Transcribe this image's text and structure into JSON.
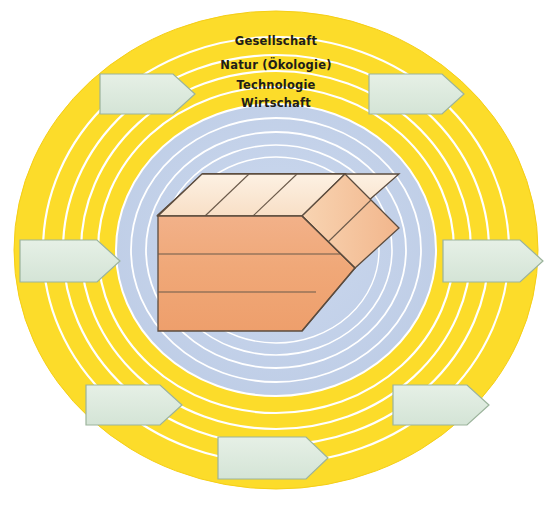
{
  "diagram": {
    "type": "concentric-rings-with-arrows",
    "canvas": {
      "width": 552,
      "height": 506
    }
  },
  "rings": {
    "environment_color": "#FCDC2A",
    "inner_color": "#C3D1E8",
    "separator_color": "#FFFFFF",
    "labels": [
      {
        "id": "gesellschaft",
        "label": "Gesellschaft",
        "x": 276,
        "y": 44
      },
      {
        "id": "natur",
        "label": "Natur (Ökologie)",
        "x": 276,
        "y": 68
      },
      {
        "id": "technologie",
        "label": "Technologie",
        "x": 276,
        "y": 88
      },
      {
        "id": "wirtschaft",
        "label": "Wirtschaft",
        "x": 276,
        "y": 106
      }
    ]
  },
  "arrows": {
    "fill_color": "#DDEADD",
    "stroke_color": "#9BB39B",
    "count": 8,
    "direction": "right",
    "items": [
      {
        "id": "arrow-top-left",
        "x": 100,
        "y": 74,
        "w": 95,
        "h": 40
      },
      {
        "id": "arrow-top-right",
        "x": 369,
        "y": 74,
        "w": 95,
        "h": 40
      },
      {
        "id": "arrow-middle-left",
        "x": 20,
        "y": 240,
        "w": 100,
        "h": 42
      },
      {
        "id": "arrow-middle-right",
        "x": 443,
        "y": 240,
        "w": 100,
        "h": 42
      },
      {
        "id": "arrow-bottom-left",
        "x": 86,
        "y": 385,
        "w": 96,
        "h": 40
      },
      {
        "id": "arrow-bottom-right",
        "x": 393,
        "y": 385,
        "w": 96,
        "h": 40
      },
      {
        "id": "arrow-bottom",
        "x": 218,
        "y": 437,
        "w": 110,
        "h": 42
      },
      {
        "id": "arrow-top-center",
        "x": 0,
        "y": 0,
        "w": 0,
        "h": 0
      }
    ]
  },
  "core_block": {
    "id": "enterprise-block",
    "description": "3D arrow-shaped block (Unternehmen) pointing right",
    "top_face_color": "#FAE6D1",
    "top_face_color_light": "#FBEBDB",
    "front_face_color": "#F0A878",
    "side_face_color": "#F6C69E",
    "outline_color": "#5C4C3E",
    "top_slice_count": 4,
    "front_slice_count": 3
  },
  "colors": {
    "yellow": "#FCDC2A",
    "yellow_edge": "#F8D118",
    "blue_gray": "#C3D1E8",
    "blue_gray_light": "#CAD7EC",
    "arrow_green": "#DDEADD",
    "orange_front": "#F0A878",
    "cream_top": "#FAE6D1",
    "text": "#211d18"
  }
}
